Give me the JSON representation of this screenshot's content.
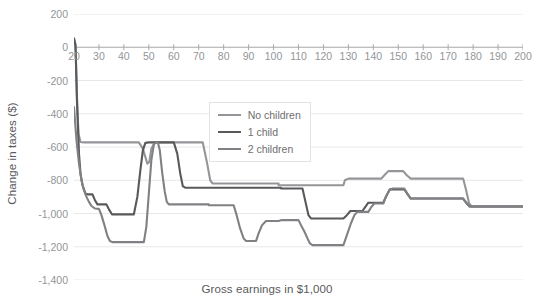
{
  "chart_data": {
    "type": "line",
    "title": "",
    "xlabel": "Gross earnings in $1,000",
    "ylabel": "Change in taxes ($)",
    "xlim": [
      20,
      200
    ],
    "ylim": [
      -1400,
      200
    ],
    "xticks": [
      20,
      30,
      40,
      50,
      60,
      70,
      80,
      90,
      100,
      110,
      120,
      130,
      140,
      150,
      160,
      170,
      180,
      190,
      200
    ],
    "yticks": [
      200,
      0,
      -200,
      -400,
      -600,
      -800,
      -1000,
      -1200,
      -1400
    ],
    "ytick_labels": [
      "200",
      "0",
      "-200",
      "-400",
      "-600",
      "-800",
      "-1,000",
      "-1,200",
      "-1,400"
    ],
    "grid": "horizontal",
    "legend_position": "upper-center-right",
    "series": [
      {
        "name": "No children",
        "color": "#949598",
        "width": 2.1,
        "points": [
          [
            20,
            55
          ],
          [
            20.6,
            20
          ],
          [
            21.2,
            -300
          ],
          [
            21.8,
            -520
          ],
          [
            22.6,
            -570
          ],
          [
            24,
            -572
          ],
          [
            46,
            -572
          ],
          [
            47.6,
            -610
          ],
          [
            49.4,
            -700
          ],
          [
            50.2,
            -690
          ],
          [
            51,
            -610
          ],
          [
            52.4,
            -572
          ],
          [
            71.6,
            -572
          ],
          [
            73.4,
            -700
          ],
          [
            74.6,
            -800
          ],
          [
            75.6,
            -820
          ],
          [
            102,
            -820
          ],
          [
            102,
            -830
          ],
          [
            128,
            -830
          ],
          [
            128.6,
            -800
          ],
          [
            130,
            -790
          ],
          [
            143.2,
            -790
          ],
          [
            144.4,
            -770
          ],
          [
            146,
            -745
          ],
          [
            152,
            -745
          ],
          [
            153.4,
            -770
          ],
          [
            155,
            -790
          ],
          [
            176,
            -790
          ],
          [
            177.2,
            -860
          ],
          [
            178.4,
            -940
          ],
          [
            179.4,
            -958
          ],
          [
            200,
            -958
          ]
        ]
      },
      {
        "name": "1 child",
        "color": "#58595b",
        "width": 2.1,
        "points": [
          [
            20,
            50
          ],
          [
            20.6,
            10
          ],
          [
            21.2,
            -330
          ],
          [
            22,
            -640
          ],
          [
            22.6,
            -760
          ],
          [
            23.4,
            -830
          ],
          [
            24.6,
            -880
          ],
          [
            25.6,
            -885
          ],
          [
            27.4,
            -885
          ],
          [
            28.4,
            -920
          ],
          [
            29.4,
            -945
          ],
          [
            33,
            -945
          ],
          [
            34,
            -975
          ],
          [
            35.2,
            -1005
          ],
          [
            44,
            -1005
          ],
          [
            45.4,
            -900
          ],
          [
            46.6,
            -740
          ],
          [
            47.6,
            -620
          ],
          [
            48.6,
            -575
          ],
          [
            50,
            -572
          ],
          [
            60,
            -572
          ],
          [
            61.4,
            -640
          ],
          [
            62.6,
            -760
          ],
          [
            63.6,
            -835
          ],
          [
            64.6,
            -845
          ],
          [
            103,
            -845
          ],
          [
            103,
            -850
          ],
          [
            111.6,
            -850
          ],
          [
            112.8,
            -930
          ],
          [
            114,
            -1010
          ],
          [
            115,
            -1030
          ],
          [
            128,
            -1030
          ],
          [
            129.4,
            -1010
          ],
          [
            130.8,
            -985
          ],
          [
            135.6,
            -985
          ],
          [
            136.8,
            -960
          ],
          [
            138,
            -935
          ],
          [
            144,
            -935
          ],
          [
            145.2,
            -895
          ],
          [
            146.6,
            -855
          ],
          [
            152.4,
            -855
          ],
          [
            153.6,
            -880
          ],
          [
            155,
            -910
          ],
          [
            176,
            -910
          ],
          [
            177.2,
            -935
          ],
          [
            178.6,
            -958
          ],
          [
            180,
            -958
          ],
          [
            200,
            -958
          ]
        ]
      },
      {
        "name": "2 children",
        "color": "#808184",
        "width": 2.1,
        "points": [
          [
            20,
            -360
          ],
          [
            21,
            -560
          ],
          [
            22,
            -700
          ],
          [
            23,
            -800
          ],
          [
            24,
            -860
          ],
          [
            25,
            -900
          ],
          [
            26,
            -930
          ],
          [
            27,
            -955
          ],
          [
            28.4,
            -970
          ],
          [
            30,
            -972
          ],
          [
            31,
            -1010
          ],
          [
            32.2,
            -1070
          ],
          [
            33.4,
            -1135
          ],
          [
            34.4,
            -1165
          ],
          [
            35.4,
            -1172
          ],
          [
            48,
            -1172
          ],
          [
            49,
            -1080
          ],
          [
            50,
            -880
          ],
          [
            51,
            -680
          ],
          [
            52,
            -585
          ],
          [
            52.8,
            -572
          ],
          [
            53.6,
            -572
          ],
          [
            54.4,
            -620
          ],
          [
            55.4,
            -760
          ],
          [
            56.4,
            -870
          ],
          [
            57.2,
            -930
          ],
          [
            58,
            -945
          ],
          [
            74,
            -945
          ],
          [
            74,
            -950
          ],
          [
            84,
            -950
          ],
          [
            85.2,
            -1010
          ],
          [
            86.6,
            -1090
          ],
          [
            88,
            -1150
          ],
          [
            89,
            -1165
          ],
          [
            93,
            -1165
          ],
          [
            94,
            -1120
          ],
          [
            95.4,
            -1070
          ],
          [
            97,
            -1045
          ],
          [
            102,
            -1045
          ],
          [
            103,
            -1040
          ],
          [
            110,
            -1040
          ],
          [
            111,
            -1070
          ],
          [
            112.4,
            -1110
          ],
          [
            113.6,
            -1150
          ],
          [
            114.6,
            -1180
          ],
          [
            115.6,
            -1190
          ],
          [
            128,
            -1190
          ],
          [
            129.4,
            -1130
          ],
          [
            131,
            -1060
          ],
          [
            132.4,
            -1010
          ],
          [
            133.6,
            -990
          ],
          [
            138,
            -990
          ],
          [
            139,
            -965
          ],
          [
            140.4,
            -940
          ],
          [
            144,
            -940
          ],
          [
            145,
            -900
          ],
          [
            146.4,
            -860
          ],
          [
            147.6,
            -850
          ],
          [
            152.4,
            -850
          ],
          [
            153.6,
            -880
          ],
          [
            155,
            -910
          ],
          [
            176,
            -910
          ],
          [
            177.2,
            -935
          ],
          [
            178.6,
            -958
          ],
          [
            180,
            -958
          ],
          [
            200,
            -958
          ]
        ]
      }
    ]
  },
  "legend": {
    "items": [
      {
        "label": "No children",
        "color": "#949598"
      },
      {
        "label": "1 child",
        "color": "#58595b"
      },
      {
        "label": "2 children",
        "color": "#808184"
      }
    ]
  },
  "style": {
    "grid_color": "#e8e8e9",
    "zero_line_color": "#a7a9ac",
    "tick_text_color": "#939598",
    "axis_title_color": "#58595b"
  }
}
